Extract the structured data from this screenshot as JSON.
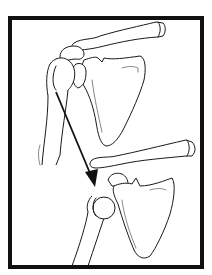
{
  "figure": {
    "description": "Line illustration of a shoulder joint shown twice: upper view with humeral head in glenoid socket, lower view with humeral head displaced anteriorly/inferiorly; an arrow indicates direction of dislocation",
    "frame": {
      "stroke_color": "#111111",
      "stroke_width": 4
    },
    "panels": [
      {
        "id": "upper",
        "label": "normal shoulder"
      },
      {
        "id": "lower",
        "label": "dislocated shoulder"
      }
    ],
    "arrow": {
      "color": "#111111",
      "direction": "down-right"
    }
  }
}
